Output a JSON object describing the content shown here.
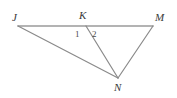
{
  "figure": {
    "type": "geometry-diagram",
    "background_color": "#ffffff",
    "line_color": "#8c8c8c",
    "label_color": "#3a3a3a",
    "vertices": [
      {
        "id": "J",
        "label": "J",
        "x": 18,
        "y": 26
      },
      {
        "id": "K",
        "label": "K",
        "x": 86,
        "y": 26
      },
      {
        "id": "M",
        "label": "M",
        "x": 153,
        "y": 26
      },
      {
        "id": "N",
        "label": "N",
        "x": 118,
        "y": 78
      }
    ],
    "segments": [
      {
        "id": "JM",
        "from": "J",
        "to": "M",
        "color": "#9a9a9a",
        "width": 1.6
      },
      {
        "id": "JN",
        "from": "J",
        "to": "N",
        "color": "#8a8a8a",
        "width": 1.2
      },
      {
        "id": "KN",
        "from": "K",
        "to": "N",
        "color": "#8a8a8a",
        "width": 1.2
      },
      {
        "id": "MN",
        "from": "M",
        "to": "N",
        "color": "#8a8a8a",
        "width": 1.2
      }
    ],
    "angle_labels": [
      {
        "id": "angle-1",
        "label": "1",
        "x": 75,
        "y": 30
      },
      {
        "id": "angle-2",
        "label": "2",
        "x": 92,
        "y": 30
      }
    ]
  }
}
